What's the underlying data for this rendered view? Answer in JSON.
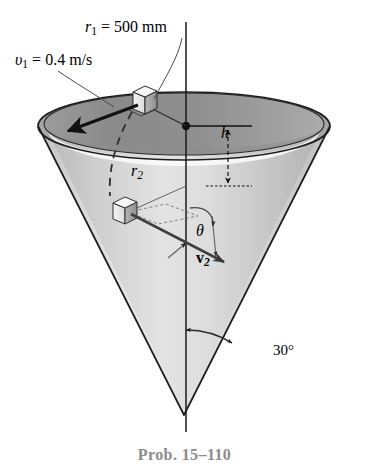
{
  "figure": {
    "kind": "engineering-diagram",
    "caption": "Prob. 15–110",
    "caption_color": "#8c8c8c"
  },
  "labels": {
    "r1": {
      "sym": "r",
      "sub": "1",
      "eq": " = 500 mm",
      "full": "r₁ = 500 mm"
    },
    "v1": {
      "sym": "υ",
      "sub": "1",
      "eq": " = 0.4 m/s",
      "full": "υ₁ = 0.4 m/s"
    },
    "h": {
      "sym": "h",
      "full": "h"
    },
    "r2": {
      "sym": "r",
      "sub": "2",
      "full": "r₂"
    },
    "theta": {
      "sym": "θ",
      "full": "θ"
    },
    "v2": {
      "sym": "v",
      "sub": "2",
      "full": "v₂"
    },
    "angle30": {
      "full": "30°"
    }
  },
  "values": {
    "r1_mm": 500,
    "v1_m_per_s": 0.4,
    "half_angle_deg": 30
  },
  "colors": {
    "outline": "#1a1a1a",
    "cone_inner_dark": "#8a8a8a",
    "cone_inner_mid": "#b4b4b4",
    "cone_outer_light": "#e8e8e8",
    "cone_outer_mid": "#c9c9c9",
    "rim_highlight": "#fdfdfd",
    "leader": "#555555",
    "dashed_path": "#333333",
    "caption": "#8c8c8c",
    "background": "#ffffff"
  },
  "geometry": {
    "top_rim_center_x": 184,
    "top_rim_center_y": 126,
    "top_rim_rx": 146,
    "top_rim_ry": 34,
    "apex_x": 184,
    "apex_y": 415,
    "axis_top_y": 22,
    "axis_bottom_y": 432
  }
}
